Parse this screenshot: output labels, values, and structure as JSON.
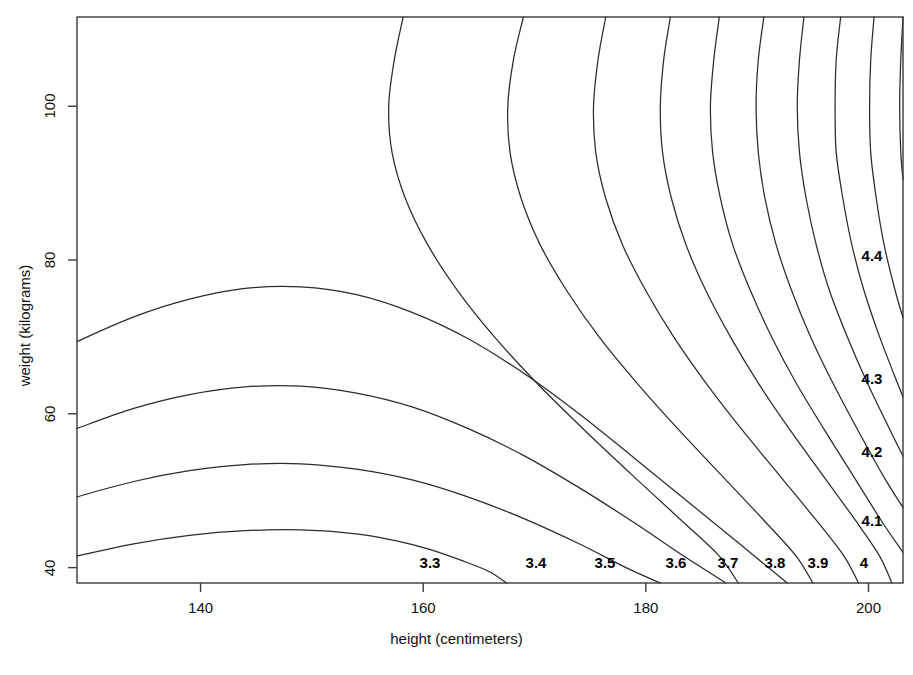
{
  "chart_data": {
    "type": "line",
    "subtype": "contour",
    "title": "",
    "xlabel": "height (centimeters)",
    "ylabel": "weight (kilograms)",
    "xlim": [
      128.9,
      203.1
    ],
    "ylim": [
      38.0,
      111.6
    ],
    "xticks": [
      140,
      160,
      180,
      200
    ],
    "xtick_labels": [
      "140",
      "160",
      "180",
      "200"
    ],
    "yticks": [
      40,
      60,
      80,
      100
    ],
    "ytick_labels": [
      "40",
      "60",
      "80",
      "100"
    ],
    "grid": false,
    "legend": "none",
    "frame": true,
    "contour_levels": [
      3.0,
      3.1,
      3.2,
      3.3,
      3.4,
      3.5,
      3.6,
      3.7,
      3.8,
      3.9,
      4.0,
      4.1,
      4.2,
      4.3,
      4.4
    ],
    "contour_labels": [
      {
        "text": "3.3",
        "x": 430,
        "y": 562
      },
      {
        "text": "3.4",
        "x": 536,
        "y": 562
      },
      {
        "text": "3.5",
        "x": 605,
        "y": 562
      },
      {
        "text": "3.6",
        "x": 676,
        "y": 562
      },
      {
        "text": "3.7",
        "x": 728,
        "y": 562
      },
      {
        "text": "3.8",
        "x": 775,
        "y": 562
      },
      {
        "text": "3.9",
        "x": 818,
        "y": 562
      },
      {
        "text": "4",
        "x": 864,
        "y": 562
      },
      {
        "text": "4.1",
        "x": 872,
        "y": 520
      },
      {
        "text": "4.2",
        "x": 872,
        "y": 451
      },
      {
        "text": "4.3",
        "x": 872,
        "y": 378
      },
      {
        "text": "4.4",
        "x": 872,
        "y": 255
      }
    ],
    "contours": [
      {
        "level": 3.0,
        "points": [
          [
            128.9,
            69.4
          ],
          [
            134.0,
            72.6
          ],
          [
            139.0,
            74.9
          ],
          [
            144.0,
            76.3
          ],
          [
            149.0,
            76.5
          ],
          [
            154.0,
            75.5
          ],
          [
            159.0,
            73.2
          ],
          [
            164.0,
            69.8
          ],
          [
            169.0,
            65.3
          ],
          [
            174.0,
            60.0
          ],
          [
            179.0,
            54.2
          ],
          [
            184.0,
            48.3
          ],
          [
            188.5,
            43.0
          ],
          [
            192.7,
            38.0
          ]
        ]
      },
      {
        "level": 3.1,
        "points": [
          [
            128.9,
            58.1
          ],
          [
            134.0,
            60.7
          ],
          [
            139.0,
            62.5
          ],
          [
            144.0,
            63.5
          ],
          [
            149.0,
            63.6
          ],
          [
            154.0,
            62.7
          ],
          [
            159.0,
            60.9
          ],
          [
            164.0,
            58.1
          ],
          [
            169.0,
            54.6
          ],
          [
            174.0,
            50.4
          ],
          [
            179.0,
            45.8
          ],
          [
            183.5,
            41.4
          ],
          [
            187.2,
            38.0
          ]
        ]
      },
      {
        "level": 3.2,
        "points": [
          [
            128.9,
            49.2
          ],
          [
            134.0,
            51.2
          ],
          [
            139.0,
            52.6
          ],
          [
            144.0,
            53.4
          ],
          [
            149.0,
            53.5
          ],
          [
            154.0,
            52.8
          ],
          [
            159.0,
            51.4
          ],
          [
            164.0,
            49.2
          ],
          [
            169.0,
            46.4
          ],
          [
            174.0,
            43.1
          ],
          [
            178.5,
            39.8
          ],
          [
            181.3,
            38.0
          ]
        ]
      },
      {
        "level": 3.3,
        "points": [
          [
            128.9,
            41.5
          ],
          [
            134.0,
            43.1
          ],
          [
            139.0,
            44.2
          ],
          [
            144.0,
            44.8
          ],
          [
            149.0,
            44.9
          ],
          [
            154.0,
            44.4
          ],
          [
            157.5,
            43.5
          ],
          [
            160.5,
            42.4
          ],
          [
            163.5,
            40.9
          ],
          [
            165.9,
            39.5
          ],
          [
            167.5,
            38.0
          ]
        ]
      },
      {
        "level": 3.4,
        "points": [
          [
            158.2,
            111.6
          ],
          [
            157.4,
            106.0
          ],
          [
            156.9,
            100.0
          ],
          [
            157.2,
            94.0
          ],
          [
            158.4,
            88.0
          ],
          [
            160.4,
            82.0
          ],
          [
            163.1,
            76.0
          ],
          [
            166.4,
            70.0
          ],
          [
            170.2,
            64.0
          ],
          [
            174.4,
            58.0
          ],
          [
            178.8,
            52.0
          ],
          [
            183.3,
            46.0
          ],
          [
            186.6,
            41.5
          ],
          [
            188.3,
            38.0
          ]
        ]
      },
      {
        "level": 3.5,
        "points": [
          [
            169.0,
            111.6
          ],
          [
            168.1,
            106.0
          ],
          [
            167.6,
            100.0
          ],
          [
            167.8,
            94.0
          ],
          [
            168.8,
            88.0
          ],
          [
            170.5,
            82.0
          ],
          [
            172.9,
            76.0
          ],
          [
            175.8,
            70.0
          ],
          [
            179.2,
            64.0
          ],
          [
            182.9,
            58.0
          ],
          [
            186.8,
            52.0
          ],
          [
            190.7,
            46.0
          ],
          [
            193.5,
            41.5
          ],
          [
            195.0,
            38.0
          ]
        ]
      },
      {
        "level": 3.6,
        "points": [
          [
            176.4,
            111.6
          ],
          [
            175.7,
            106.0
          ],
          [
            175.3,
            100.0
          ],
          [
            175.5,
            94.0
          ],
          [
            176.4,
            88.0
          ],
          [
            177.9,
            82.0
          ],
          [
            180.0,
            76.0
          ],
          [
            182.5,
            70.0
          ],
          [
            185.4,
            64.0
          ],
          [
            188.6,
            58.0
          ],
          [
            192.0,
            52.0
          ],
          [
            195.4,
            46.0
          ],
          [
            197.8,
            41.5
          ],
          [
            199.1,
            38.0
          ]
        ]
      },
      {
        "level": 3.7,
        "points": [
          [
            182.2,
            111.6
          ],
          [
            181.6,
            106.0
          ],
          [
            181.3,
            100.0
          ],
          [
            181.5,
            94.0
          ],
          [
            182.3,
            88.0
          ],
          [
            183.6,
            82.0
          ],
          [
            185.4,
            76.0
          ],
          [
            187.6,
            70.0
          ],
          [
            190.1,
            64.0
          ],
          [
            192.9,
            58.0
          ],
          [
            195.9,
            52.0
          ],
          [
            198.9,
            46.0
          ],
          [
            201.0,
            41.5
          ],
          [
            202.1,
            38.0
          ]
        ]
      },
      {
        "level": 3.8,
        "points": [
          [
            186.6,
            111.6
          ],
          [
            186.1,
            106.0
          ],
          [
            185.8,
            100.0
          ],
          [
            186.0,
            94.0
          ],
          [
            186.7,
            88.0
          ],
          [
            187.8,
            82.0
          ],
          [
            189.4,
            76.0
          ],
          [
            191.3,
            70.0
          ],
          [
            193.5,
            64.0
          ],
          [
            196.0,
            58.0
          ],
          [
            198.6,
            52.0
          ],
          [
            201.2,
            46.0
          ],
          [
            203.1,
            42.0
          ]
        ]
      },
      {
        "level": 3.9,
        "points": [
          [
            190.6,
            111.6
          ],
          [
            190.1,
            106.0
          ],
          [
            189.9,
            100.0
          ],
          [
            190.1,
            94.0
          ],
          [
            190.7,
            88.0
          ],
          [
            191.7,
            82.0
          ],
          [
            193.1,
            76.0
          ],
          [
            194.8,
            70.0
          ],
          [
            196.8,
            64.0
          ],
          [
            199.0,
            58.0
          ],
          [
            201.3,
            52.0
          ],
          [
            203.1,
            47.8
          ]
        ]
      },
      {
        "level": 4.0,
        "points": [
          [
            194.2,
            111.6
          ],
          [
            193.8,
            106.0
          ],
          [
            193.6,
            100.0
          ],
          [
            193.8,
            94.0
          ],
          [
            194.4,
            88.0
          ],
          [
            195.3,
            82.0
          ],
          [
            196.5,
            76.0
          ],
          [
            198.1,
            70.0
          ],
          [
            199.9,
            64.0
          ],
          [
            201.9,
            58.0
          ],
          [
            203.1,
            54.5
          ]
        ]
      },
      {
        "level": 4.1,
        "points": [
          [
            197.5,
            111.6
          ],
          [
            197.1,
            106.0
          ],
          [
            197.0,
            100.0
          ],
          [
            197.1,
            94.0
          ],
          [
            197.7,
            88.0
          ],
          [
            198.5,
            82.0
          ],
          [
            199.6,
            76.0
          ],
          [
            201.0,
            70.0
          ],
          [
            202.6,
            64.0
          ],
          [
            203.1,
            62.2
          ]
        ]
      },
      {
        "level": 4.2,
        "points": [
          [
            200.5,
            111.6
          ],
          [
            200.2,
            106.0
          ],
          [
            200.1,
            100.0
          ],
          [
            200.2,
            94.0
          ],
          [
            200.7,
            88.0
          ],
          [
            201.4,
            82.0
          ],
          [
            202.4,
            76.0
          ],
          [
            203.1,
            72.5
          ]
        ]
      },
      {
        "level": 4.3,
        "points": [
          [
            203.1,
            111.6
          ],
          [
            202.9,
            106.0
          ],
          [
            202.8,
            100.0
          ],
          [
            202.9,
            94.0
          ],
          [
            203.1,
            90.5
          ]
        ]
      }
    ]
  },
  "axes": {
    "x_title": "height (centimeters)",
    "y_title": "weight (kilograms)",
    "x_tick_labels": [
      "140",
      "160",
      "180",
      "200"
    ],
    "y_tick_labels": [
      "40",
      "60",
      "80",
      "100"
    ]
  },
  "style": {
    "line_color": "#2b2b2b",
    "frame_color": "#3a3a3a",
    "background": "#ffffff",
    "text_color": "#111111"
  }
}
